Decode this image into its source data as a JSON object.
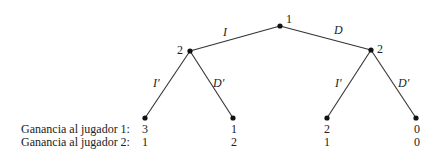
{
  "diagram": {
    "type": "game-tree",
    "nodes": {
      "root": {
        "player_label": "1",
        "x": 280,
        "y": 26
      },
      "left": {
        "player_label": "2",
        "x": 190,
        "y": 51
      },
      "right": {
        "player_label": "2",
        "x": 371,
        "y": 50
      }
    },
    "edges": {
      "root_left": {
        "label": "I"
      },
      "root_right": {
        "label": "D"
      },
      "left_ll": {
        "label": "I′"
      },
      "left_lr": {
        "label": "D′"
      },
      "right_rl": {
        "label": "I′"
      },
      "right_rr": {
        "label": "D′"
      }
    },
    "payoff_labels": {
      "player1": "Ganancia al jugador 1:",
      "player2": "Ganancia al jugador 2:"
    },
    "leaves": [
      {
        "x": 145,
        "y": 118,
        "p1": "3",
        "p2": "1"
      },
      {
        "x": 233,
        "y": 118,
        "p1": "1",
        "p2": "2"
      },
      {
        "x": 327,
        "y": 118,
        "p1": "2",
        "p2": "1"
      },
      {
        "x": 416,
        "y": 118,
        "p1": "0",
        "p2": "0"
      }
    ],
    "colors": {
      "line": "#333333",
      "node": "#111111",
      "text": "#222222"
    }
  }
}
